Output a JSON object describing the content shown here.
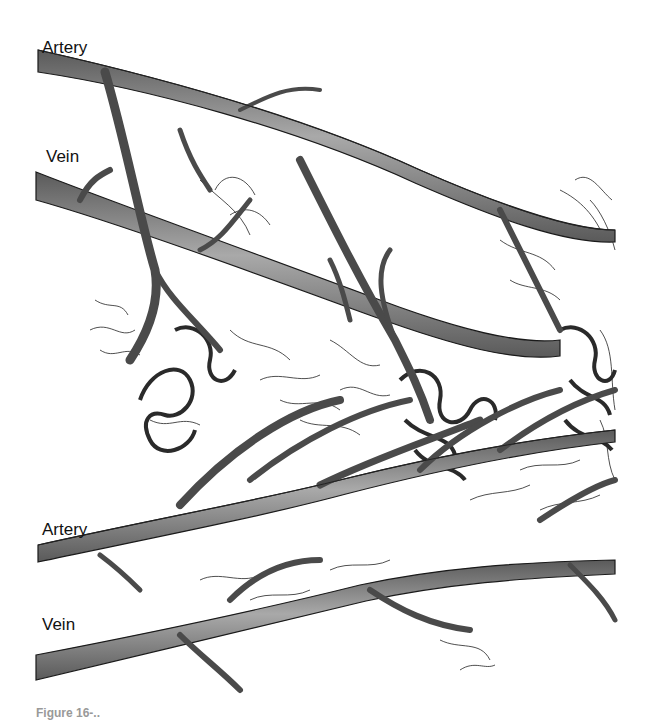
{
  "diagram": {
    "type": "vascular-network-illustration",
    "labels": [
      {
        "id": "artery-top",
        "text": "Artery"
      },
      {
        "id": "vein-top",
        "text": "Vein"
      },
      {
        "id": "artery-bottom",
        "text": "Artery"
      },
      {
        "id": "vein-bottom",
        "text": "Vein"
      }
    ],
    "caption": "Figure 16-..",
    "colors": {
      "vessel_fill": "#6e6e6e",
      "vessel_highlight": "#a8a8a8",
      "vessel_outline": "#1a1a1a",
      "capillary": "#222222",
      "background": "#ffffff"
    }
  }
}
